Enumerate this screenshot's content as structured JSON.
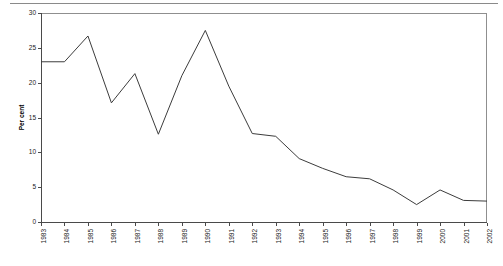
{
  "chart_data": {
    "type": "line",
    "title": "",
    "xlabel": "",
    "ylabel": "Per cent",
    "ylim": [
      0,
      30
    ],
    "ytick_step": 5,
    "yticks": [
      "0",
      "5",
      "10",
      "15",
      "20",
      "25",
      "30"
    ],
    "grid": false,
    "legend": null,
    "line_color": "#3c3c3c",
    "axis_color": "#4a4a4a",
    "frame_color": "#8f8f8f",
    "background": "#ffffff",
    "categories": [
      "1983",
      "1984",
      "1985",
      "1986",
      "1987",
      "1988",
      "1989",
      "1990",
      "1991",
      "1992",
      "1993",
      "1994",
      "1995",
      "1996",
      "1997",
      "1998",
      "1999",
      "2000",
      "2001",
      "2002"
    ],
    "values": [
      23.0,
      23.0,
      26.7,
      17.1,
      21.3,
      12.6,
      21.0,
      27.5,
      19.5,
      12.7,
      12.3,
      9.1,
      7.7,
      6.5,
      6.2,
      4.6,
      2.5,
      4.6,
      3.1,
      3.0
    ],
    "series": [
      {
        "name": "Per cent",
        "values": [
          23.0,
          23.0,
          26.7,
          17.1,
          21.3,
          12.6,
          21.0,
          27.5,
          19.5,
          12.7,
          12.3,
          9.1,
          7.7,
          6.5,
          6.2,
          4.6,
          2.5,
          4.6,
          3.1,
          3.0
        ]
      }
    ]
  },
  "layout": {
    "plot_left": 41,
    "plot_right": 487,
    "plot_top": 13,
    "plot_bottom": 222
  }
}
